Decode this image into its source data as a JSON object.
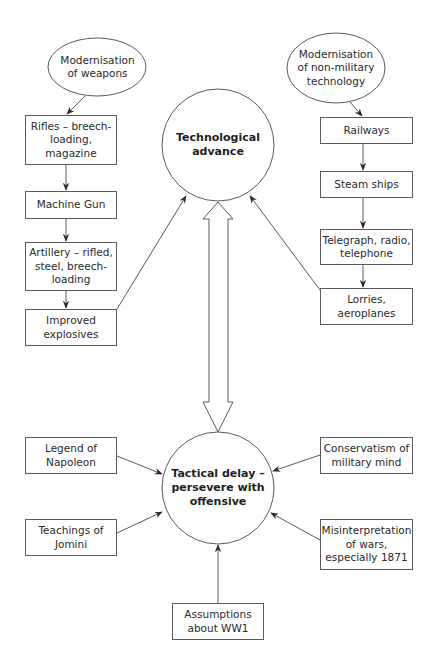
{
  "diagram": {
    "title": "",
    "colors": {
      "stroke": "#5a5a5a",
      "text": "#2a2a2a",
      "background": "#ffffff"
    },
    "nodes": {
      "mod_weapons": {
        "label": "Modernisation\nof weapons",
        "shape": "ellipse"
      },
      "mod_nonmil": {
        "label": "Modernisation\nof non-military\ntechnology",
        "shape": "ellipse"
      },
      "rifles": {
        "label": "Rifles – breech-\nloading,\nmagazine",
        "shape": "box"
      },
      "machine_gun": {
        "label": "Machine Gun",
        "shape": "box"
      },
      "artillery": {
        "label": "Artillery – rifled,\nsteel, breech-\nloading",
        "shape": "box"
      },
      "explosives": {
        "label": "Improved\nexplosives",
        "shape": "box"
      },
      "railways": {
        "label": "Railways",
        "shape": "box"
      },
      "steam_ships": {
        "label": "Steam ships",
        "shape": "box"
      },
      "telegraph": {
        "label": "Telegraph, radio,\ntelephone",
        "shape": "box"
      },
      "lorries": {
        "label": "Lorries,\naeroplanes",
        "shape": "box"
      },
      "tech_advance": {
        "label": "Technological\nadvance",
        "shape": "circle"
      },
      "tactical_delay": {
        "label": "Tactical delay –\npersevere with\noffensive",
        "shape": "circle"
      },
      "napoleon": {
        "label": "Legend of\nNapoleon",
        "shape": "box"
      },
      "jomini": {
        "label": "Teachings of\nJomini",
        "shape": "box"
      },
      "conservatism": {
        "label": "Conservatism of\nmilitary mind",
        "shape": "box"
      },
      "misinterpretation": {
        "label": "Misinterpretation\nof wars,\nespecially 1871",
        "shape": "box"
      },
      "assumptions": {
        "label": "Assumptions\nabout WW1",
        "shape": "box"
      }
    },
    "edges": [
      {
        "from": "mod_weapons",
        "to": "rifles"
      },
      {
        "from": "rifles",
        "to": "machine_gun"
      },
      {
        "from": "machine_gun",
        "to": "artillery"
      },
      {
        "from": "artillery",
        "to": "explosives"
      },
      {
        "from": "explosives",
        "to": "tech_advance"
      },
      {
        "from": "mod_nonmil",
        "to": "railways"
      },
      {
        "from": "railways",
        "to": "steam_ships"
      },
      {
        "from": "steam_ships",
        "to": "telegraph"
      },
      {
        "from": "telegraph",
        "to": "lorries"
      },
      {
        "from": "lorries",
        "to": "tech_advance"
      },
      {
        "from": "tech_advance",
        "to": "tactical_delay",
        "style": "double-hollow-arrow"
      },
      {
        "from": "napoleon",
        "to": "tactical_delay"
      },
      {
        "from": "jomini",
        "to": "tactical_delay"
      },
      {
        "from": "conservatism",
        "to": "tactical_delay"
      },
      {
        "from": "misinterpretation",
        "to": "tactical_delay"
      },
      {
        "from": "assumptions",
        "to": "tactical_delay"
      }
    ]
  }
}
